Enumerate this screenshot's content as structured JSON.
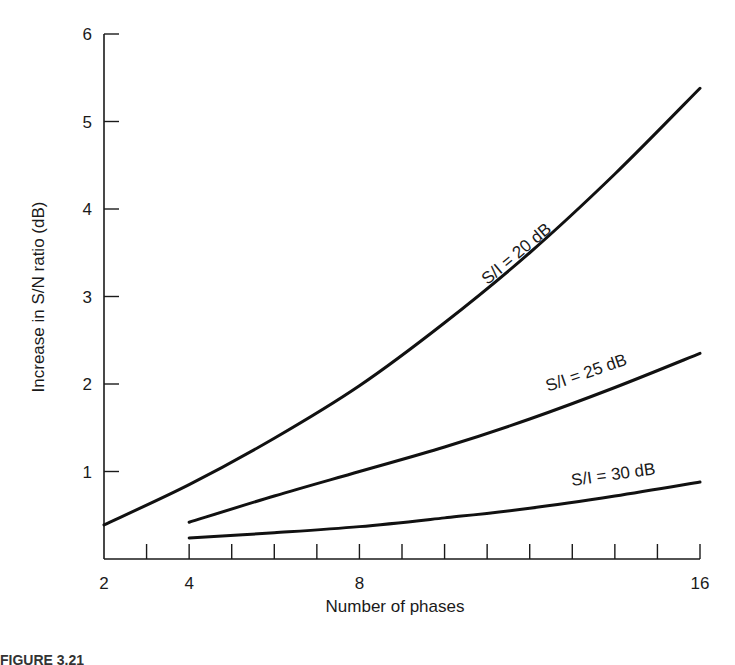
{
  "chart_data": {
    "type": "line",
    "title": "",
    "xlabel": "Number of phases",
    "ylabel": "Increase in S/N ratio (dB)",
    "xlim": [
      2,
      16
    ],
    "ylim": [
      0,
      6
    ],
    "x_ticks": [
      2,
      3,
      4,
      5,
      6,
      7,
      8,
      9,
      10,
      11,
      12,
      13,
      14,
      15,
      16
    ],
    "x_tick_labels": [
      "2",
      "4",
      "8",
      "16"
    ],
    "x_labeled_ticks": [
      2,
      4,
      8,
      16
    ],
    "y_ticks": [
      1,
      2,
      3,
      4,
      5,
      6
    ],
    "y_tick_labels": [
      "1",
      "2",
      "3",
      "4",
      "5",
      "6"
    ],
    "grid": false,
    "legend": "inline labels on curves",
    "series": [
      {
        "name": "S/I = 20 dB",
        "label": "S/I = 20 dB",
        "x": [
          2,
          4,
          6,
          8,
          10,
          12,
          14,
          16
        ],
        "y": [
          0.39,
          0.85,
          1.38,
          1.98,
          2.7,
          3.5,
          4.4,
          5.38
        ]
      },
      {
        "name": "S/I = 25 dB",
        "label": "S/I = 25 dB",
        "x": [
          4,
          6,
          8,
          10,
          12,
          14,
          16
        ],
        "y": [
          0.42,
          0.72,
          1.0,
          1.28,
          1.6,
          1.96,
          2.35
        ]
      },
      {
        "name": "S/I = 30 dB",
        "label": "S/I = 30 dB",
        "x": [
          4,
          6,
          8,
          10,
          12,
          14,
          16
        ],
        "y": [
          0.24,
          0.3,
          0.37,
          0.47,
          0.58,
          0.72,
          0.88
        ]
      }
    ]
  },
  "caption": {
    "text": "FIGURE 3.21"
  }
}
